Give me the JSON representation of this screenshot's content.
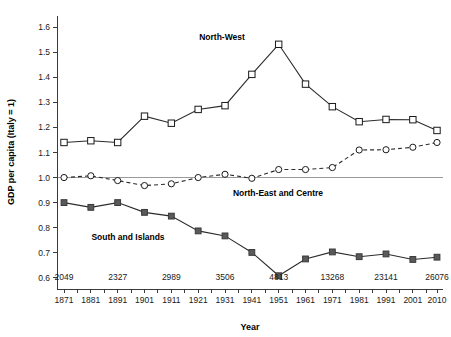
{
  "chart_data": {
    "type": "line",
    "title": "",
    "xlabel": "Year",
    "ylabel": "GDP per capita (Italy = 1)",
    "ylim": [
      0.55,
      1.65
    ],
    "yticks": [
      "0.6",
      "0.7",
      "0.8",
      "0.9",
      "1.0",
      "1.1",
      "1.2",
      "1.3",
      "1.4",
      "1.5",
      "1.6"
    ],
    "ytick_values": [
      0.6,
      0.7,
      0.8,
      0.9,
      1.0,
      1.1,
      1.2,
      1.3,
      1.4,
      1.5,
      1.6
    ],
    "grid": false,
    "reference_line": 1.0,
    "legend_position": "inline-annotations",
    "categories": [
      "1871",
      "1881",
      "1891",
      "1901",
      "1911",
      "1921",
      "1931",
      "1941",
      "1951",
      "1961",
      "1971",
      "1981",
      "1991",
      "2001",
      "2010"
    ],
    "x": [
      1871,
      1881,
      1891,
      1901,
      1911,
      1921,
      1931,
      1941,
      1951,
      1961,
      1971,
      1981,
      1991,
      2001,
      2010
    ],
    "xticks_minor": [
      1876,
      1886,
      1896,
      1906,
      1916,
      1926,
      1936,
      1946,
      1956,
      1966,
      1976,
      1986,
      1996,
      2006
    ],
    "series": [
      {
        "name": "North-West",
        "marker": "open-square",
        "linestyle": "solid",
        "values": [
          1.14,
          1.147,
          1.14,
          1.245,
          1.217,
          1.272,
          1.287,
          1.412,
          1.532,
          1.373,
          1.283,
          1.223,
          1.232,
          1.231,
          1.188
        ]
      },
      {
        "name": "North-East and Centre",
        "marker": "open-circle",
        "linestyle": "dashed",
        "values": [
          1.0,
          1.007,
          0.988,
          0.968,
          0.975,
          1.0,
          1.013,
          0.997,
          1.032,
          1.032,
          1.04,
          1.11,
          1.111,
          1.121,
          1.14
        ]
      },
      {
        "name": "South and Islands",
        "marker": "filled-square",
        "linestyle": "solid",
        "values": [
          0.9,
          0.881,
          0.9,
          0.861,
          0.846,
          0.787,
          0.767,
          0.701,
          0.608,
          0.675,
          0.703,
          0.684,
          0.695,
          0.673,
          0.682
        ]
      }
    ],
    "annotations": [
      {
        "text": "2049",
        "x": 1871
      },
      {
        "text": "2327",
        "x": 1891
      },
      {
        "text": "2989",
        "x": 1911
      },
      {
        "text": "3506",
        "x": 1931
      },
      {
        "text": "4813",
        "x": 1951
      },
      {
        "text": "13268",
        "x": 1971
      },
      {
        "text": "23141",
        "x": 1991
      },
      {
        "text": "26076",
        "x": 2010
      }
    ],
    "series_labels": [
      {
        "text": "North-West",
        "x": 222,
        "y": 40
      },
      {
        "text": "North-East and Centre",
        "x": 278,
        "y": 196
      },
      {
        "text": "South and Islands",
        "x": 128,
        "y": 240
      }
    ],
    "colors": {
      "line": "#2b2b2b",
      "filled_marker": "#5a5a5a",
      "axis": "#3a3a3a",
      "reference_line": "#9a9a9a",
      "background": "#ffffff"
    }
  }
}
